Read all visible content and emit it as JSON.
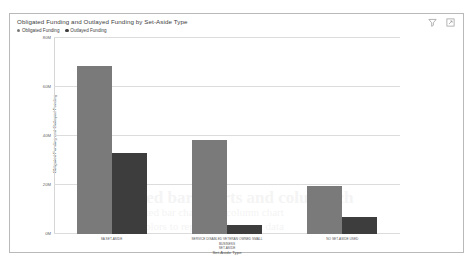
{
  "card": {
    "title": "Obligated Funding and Outlayed Funding by Set-Aside Type",
    "icons": [
      {
        "name": "filter-icon",
        "label": "Filter"
      },
      {
        "name": "expand-icon",
        "label": "Focus mode"
      }
    ]
  },
  "chart_data": {
    "type": "bar",
    "title": "Obligated Funding and Outlayed Funding by Set-Aside Type",
    "xlabel": "Set-Aside Type",
    "ylabel": "Obligated Funding and Outlayed Funding",
    "categories": [
      "8A SET-ASIDE",
      "SERVICE DISABLED VETERAN OWNED SMALL BUSINESS SET-ASIDE",
      "NO SET-ASIDE USED"
    ],
    "category_lines": [
      [
        "8A SET-ASIDE"
      ],
      [
        "SERVICE DISABLED VETERAN OWNED SMALL BUSINESS",
        "SET-ASIDE"
      ],
      [
        "NO SET-ASIDE USED"
      ]
    ],
    "series": [
      {
        "name": "Obligated Funding",
        "color": "#7a7a7a",
        "values": [
          68.6,
          38.4,
          19.6
        ]
      },
      {
        "name": "Outlayed Funding",
        "color": "#3d3d3d",
        "values": [
          33.0,
          3.7,
          7.0
        ]
      }
    ],
    "ylim": [
      0,
      80
    ],
    "yticks": [
      0,
      20,
      40,
      60,
      80
    ],
    "ytick_labels": [
      "0M",
      "20M",
      "40M",
      "60M",
      "80M"
    ],
    "grid": true,
    "legend_position": "top-left"
  },
  "bleed_text": {
    "line1": "sorted bar charts and column ch",
    "line2": "sorted bar charts and column chart",
    "line3": "colors to represent the same data",
    "line4": "page header bleed"
  }
}
